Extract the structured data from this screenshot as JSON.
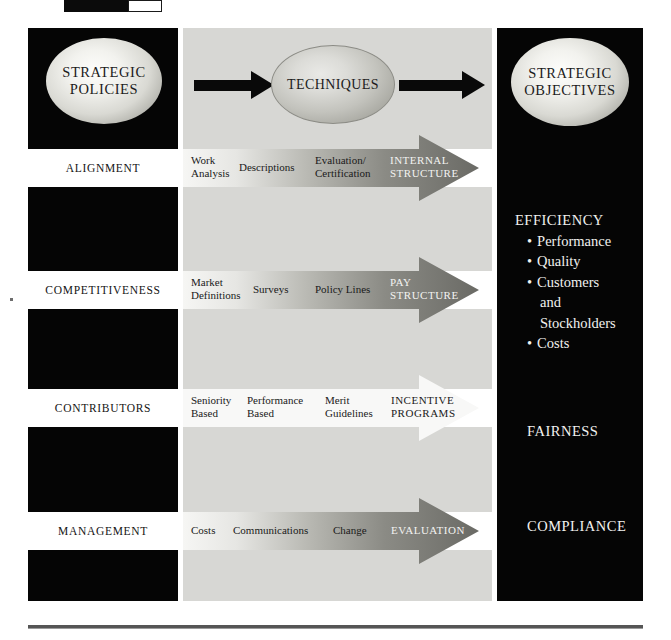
{
  "figure": {
    "left_panel": {
      "title_line1": "STRATEGIC",
      "title_line2": "POLICIES"
    },
    "center_panel": {
      "title": "TECHNIQUES"
    },
    "right_panel": {
      "title_line1": "STRATEGIC",
      "title_line2": "OBJECTIVES"
    }
  },
  "rows": [
    {
      "policy": "ALIGNMENT",
      "techniques": [
        "Work\nAnalysis",
        "Descriptions",
        "Evaluation/\nCertification"
      ],
      "outcome": "INTERNAL\nSTRUCTURE",
      "arrow_style": "gradient-light-to-dark"
    },
    {
      "policy": "COMPETITIVENESS",
      "techniques": [
        "Market\nDefinitions",
        "Surveys",
        "Policy Lines"
      ],
      "outcome": "PAY\nSTRUCTURE",
      "arrow_style": "gradient-light-to-dark"
    },
    {
      "policy": "CONTRIBUTORS",
      "techniques": [
        "Seniority\nBased",
        "Performance\nBased",
        "Merit\nGuidelines"
      ],
      "outcome": "INCENTIVE\nPROGRAMS",
      "arrow_style": "white"
    },
    {
      "policy": "MANAGEMENT",
      "techniques": [
        "Costs",
        "Communications",
        "Change"
      ],
      "outcome": "EVALUATION",
      "arrow_style": "gradient-light-to-dark"
    }
  ],
  "objectives": {
    "efficiency": {
      "heading": "EFFICIENCY",
      "items": [
        "Performance",
        "Quality",
        "Customers",
        "and",
        "Stockholders",
        "Costs"
      ]
    },
    "fairness": "FAIRNESS",
    "compliance": "COMPLIANCE"
  },
  "colors": {
    "panel_dark": "#050505",
    "panel_gray": "#d7d7d4",
    "band_white": "#ffffff",
    "arrow_dark": "#6b6b66",
    "arrow_light": "#f4f4f2",
    "text_light": "#f2f2f0",
    "text_dark": "#1a1a1a"
  }
}
